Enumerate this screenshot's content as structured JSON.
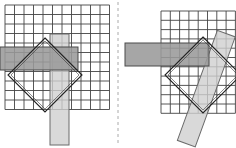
{
  "figure": {
    "title": "",
    "width": 236,
    "height": 148,
    "background": "#ffffff",
    "divider": {
      "name": "dashed-vertical-divider",
      "x": 118,
      "y1": 2,
      "y2": 146,
      "color": "#aaaaaa",
      "dash": "3 3",
      "width": 1
    },
    "colors": {
      "grid_line": "#444444",
      "grid_fill": "#ffffff",
      "dark_bar_fill": "#9a9a9a",
      "dark_bar_stroke": "#4a4a4a",
      "light_bar_fill": "#cfcfcf",
      "light_bar_stroke": "#6a6a6a",
      "diamond_stroke": "#222222",
      "diamond_fill": "none"
    },
    "panels": [
      {
        "id": "left-panel",
        "label": "Left configuration: axis-aligned vertical bar",
        "grid": {
          "x": 5,
          "y": 5,
          "cols": 11,
          "rows": 11,
          "cell": 9.5,
          "stroke_width": 0.9
        },
        "horizontal_bar": {
          "name": "horizontal-bar",
          "x": 0,
          "y": 47,
          "width": 78,
          "height": 23,
          "rotation": 0,
          "shade": "dark"
        },
        "vertical_bar": {
          "name": "vertical-bar",
          "x": 50,
          "y": 34,
          "width": 19,
          "height": 111,
          "rotation": 0,
          "shade": "light"
        },
        "diamond": {
          "name": "rotated-square-outline",
          "cx": 45,
          "cy": 75,
          "half_diagonal": 37,
          "rotation_deg": 45,
          "stroke_width": 1.1,
          "double_line": true
        }
      },
      {
        "id": "right-panel",
        "label": "Right configuration: tilted vertical bar",
        "grid": {
          "x": 161,
          "y": 11,
          "cols": 8,
          "rows": 11,
          "cell": 9.3,
          "stroke_width": 0.9
        },
        "horizontal_bar": {
          "name": "horizontal-bar",
          "x": 125,
          "y": 43,
          "width": 84,
          "height": 23,
          "rotation": 0,
          "shade": "dark"
        },
        "vertical_bar": {
          "name": "tilted-vertical-bar",
          "x": 197,
          "y": 30,
          "width": 19,
          "height": 117,
          "rotation": 20,
          "pivot_x": 206,
          "pivot_y": 88,
          "shade": "light"
        },
        "diamond": {
          "name": "rotated-square-outline",
          "cx": 203,
          "cy": 75,
          "half_diagonal": 38,
          "rotation_deg": 45,
          "stroke_width": 1.1,
          "double_line": true
        }
      }
    ]
  }
}
